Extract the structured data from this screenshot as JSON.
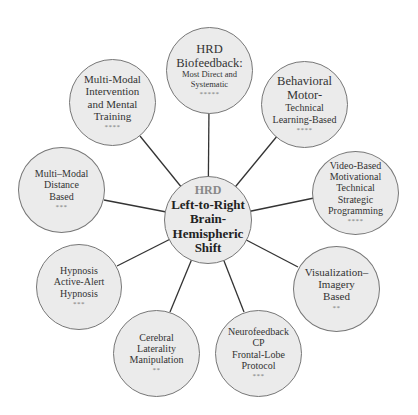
{
  "diagram": {
    "type": "hub-and-spoke",
    "center": {
      "label_prefix": "HRD",
      "lines": [
        "Left-to-Right",
        "Brain-",
        "Hemispheric",
        "Shift"
      ]
    },
    "nodes": [
      {
        "id": "hrd-biofeedback",
        "lines": [
          "HRD",
          "Biofeedback:"
        ],
        "sublines": [
          "Most Direct and",
          "Systematic"
        ],
        "rating": "*****"
      },
      {
        "id": "behavioral-motor",
        "lines": [
          "Behavioral",
          "Motor-"
        ],
        "sublines": [
          "Technical",
          "Learning-Based"
        ],
        "rating": "****"
      },
      {
        "id": "video-based",
        "lines": [
          "Video-Based",
          "Motivational",
          "Technical",
          "Strategic",
          "Programming"
        ],
        "rating": "****"
      },
      {
        "id": "visualization",
        "lines": [
          "Visualization–",
          "Imagery",
          "Based"
        ],
        "rating": "**"
      },
      {
        "id": "neurofeedback",
        "lines": [
          "Neurofeedback",
          "CP",
          "Frontal-Lobe",
          "Protocol"
        ],
        "rating": "***"
      },
      {
        "id": "cerebral-laterality",
        "lines": [
          "Cerebral",
          "Laterality",
          "Manipulation"
        ],
        "rating": "**"
      },
      {
        "id": "hypnosis",
        "lines": [
          "Hypnosis",
          "Active-Alert",
          "Hypnosis"
        ],
        "rating": "***"
      },
      {
        "id": "multi-modal-distance",
        "lines": [
          "Multi–Modal",
          "Distance",
          "Based"
        ],
        "rating": "***"
      },
      {
        "id": "multi-modal-intervention",
        "lines": [
          "Multi-Modal",
          "Intervention",
          "and Mental",
          "Training"
        ],
        "rating": "****"
      }
    ]
  },
  "colors": {
    "node_fill": "#ebebeb",
    "node_border": "#777777",
    "connector": "#333333",
    "center_prefix": "#888888"
  }
}
